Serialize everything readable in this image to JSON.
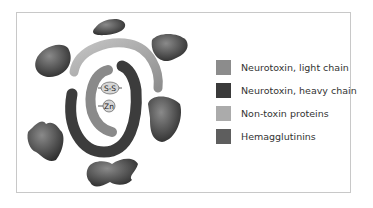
{
  "diagram": {
    "labels": {
      "disulfide": "S-S",
      "zinc": "Zn"
    }
  },
  "legend": [
    {
      "label": "Neurotoxin, light chain",
      "color": "#8c8c8c"
    },
    {
      "label": "Neurotoxin, heavy chain",
      "color": "#3a3a3a"
    },
    {
      "label": "Non-toxin proteins",
      "color": "#ababab"
    },
    {
      "label": "Hemagglutinins",
      "color": "#5e5e5e"
    }
  ]
}
